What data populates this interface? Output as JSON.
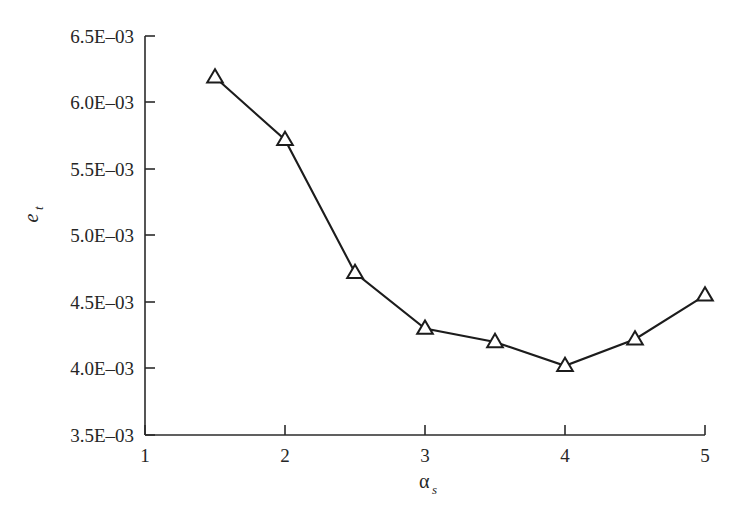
{
  "chart_data": {
    "type": "line",
    "title": "",
    "xlabel": "αₛ",
    "ylabel": "eₜ",
    "x": [
      1.5,
      2.0,
      2.5,
      3.0,
      3.5,
      4.0,
      4.5,
      5.0
    ],
    "values": [
      0.00619,
      0.00572,
      0.00472,
      0.0043,
      0.0042,
      0.00402,
      0.00422,
      0.00455
    ],
    "series": [
      {
        "name": "e_t",
        "marker": "open-triangle-up",
        "color": "#1c1c1c",
        "values": [
          0.00619,
          0.00572,
          0.00472,
          0.0043,
          0.0042,
          0.00402,
          0.00422,
          0.00455
        ]
      }
    ],
    "xlim": [
      1,
      5
    ],
    "ylim": [
      0.0035,
      0.0065
    ],
    "xticks": [
      1,
      2,
      3,
      4,
      5
    ],
    "yticks": [
      0.0035,
      0.004,
      0.0045,
      0.005,
      0.0055,
      0.006,
      0.0065
    ],
    "xtick_labels": [
      "1",
      "2",
      "3",
      "4",
      "5"
    ],
    "ytick_labels": [
      "3.5E–03",
      "4.0E–03",
      "4.5E–03",
      "5.0E–03",
      "5.5E–03",
      "6.0E–03",
      "6.5E–03"
    ],
    "grid": false,
    "legend": null
  },
  "axes": {
    "y_label_base": "e",
    "y_label_sub": "t",
    "x_label_base": "α",
    "x_label_sub": "s",
    "y_tick_labels": [
      "6.5E–03",
      "6.0E–03",
      "5.5E–03",
      "5.0E–03",
      "4.5E–03",
      "4.0E–03",
      "3.5E–03"
    ],
    "x_tick_labels": [
      "1",
      "2",
      "3",
      "4",
      "5"
    ]
  },
  "style": {
    "background": "#ffffff",
    "line_color": "#1c1c1c",
    "marker_fill": "#ffffff",
    "axis_color": "#2b2b2b",
    "text_color": "#262626"
  }
}
